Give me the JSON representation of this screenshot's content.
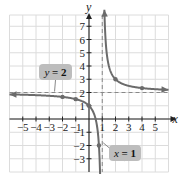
{
  "chart_data": {
    "type": "line",
    "title": "",
    "function": "y = 2 + 1/(x - 1)",
    "xlabel": "x",
    "ylabel": "y",
    "xlim": [
      -6,
      6
    ],
    "ylim": [
      -4,
      8
    ],
    "grid": true,
    "x_ticks": [
      -5,
      -4,
      -3,
      -2,
      -1,
      1,
      2,
      3,
      4,
      5
    ],
    "x_tick_labels": [
      "−5",
      "−4",
      "−3",
      "−2",
      "−1",
      "1",
      "2",
      "3",
      "4",
      "5"
    ],
    "y_ticks": [
      -3,
      -2,
      -1,
      1,
      2,
      3,
      4,
      5,
      6,
      7
    ],
    "y_tick_labels": [
      "−3",
      "−2",
      "−1",
      "1",
      "2",
      "3",
      "4",
      "5",
      "6",
      "7"
    ],
    "series": [
      {
        "name": "left branch",
        "x_range": [
          -6,
          0.87
        ],
        "marked_points": [
          [
            -2,
            1.67
          ],
          [
            -1,
            1.5
          ],
          [
            0,
            1
          ],
          [
            0.75,
            -2
          ]
        ]
      },
      {
        "name": "right branch",
        "x_range": [
          1.16,
          6
        ],
        "marked_points": [
          [
            2,
            3
          ],
          [
            4,
            2.33
          ]
        ]
      }
    ],
    "asymptotes": [
      {
        "type": "horizontal",
        "value": 2,
        "label_var": "y",
        "label_eq": " = 2"
      },
      {
        "type": "vertical",
        "value": 1,
        "label_var": "x",
        "label_eq": " = 1"
      }
    ],
    "colors": {
      "curve": "#6b6b6b",
      "grid": "#dcdcdc",
      "asymptote": "#888888",
      "callout_fill": "#bdbdbd",
      "axis": "#222222"
    }
  }
}
